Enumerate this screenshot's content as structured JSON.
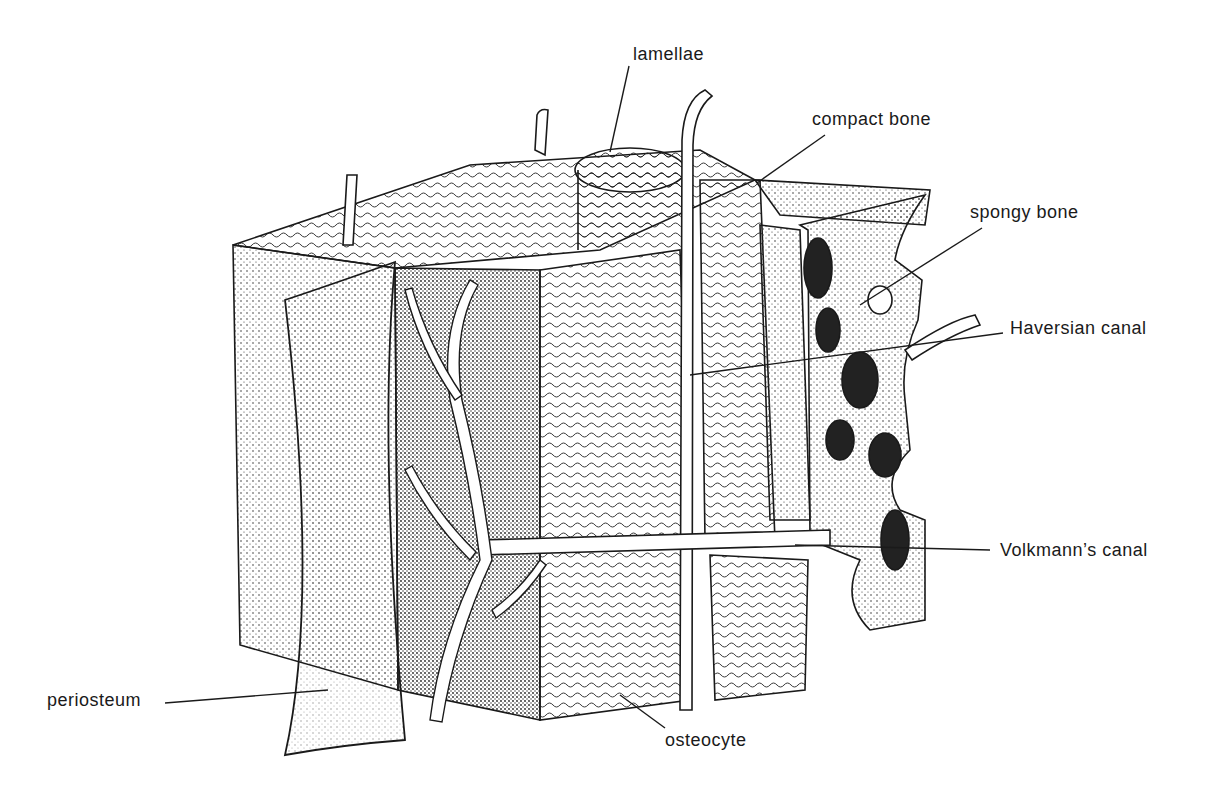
{
  "diagram": {
    "type": "anatomical-illustration",
    "colors": {
      "ink": "#1a1a1a",
      "background": "#ffffff",
      "stipple": "#3a3a3a"
    }
  },
  "labels": {
    "lamellae": "lamellae",
    "compact_bone": "compact bone",
    "spongy_bone": "spongy bone",
    "haversian_canal": "Haversian canal",
    "volkmanns_canal": "Volkmann’s canal",
    "periosteum": "periosteum",
    "osteocyte": "osteocyte"
  }
}
